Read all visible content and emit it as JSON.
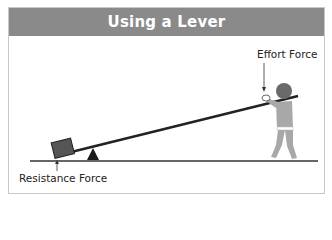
{
  "diagram": {
    "title": "Using a Lever",
    "labels": {
      "effort": "Effort Force",
      "resistance": "Resistance Force"
    },
    "elements": [
      "lever-bar",
      "fulcrum",
      "load-box",
      "person",
      "ground-line"
    ],
    "colors": {
      "header_bg": "#8a8a8a",
      "header_text": "#ffffff",
      "border": "#c8c8c8",
      "lever": "#222222",
      "fulcrum": "#1a1a1a",
      "load": "#555555",
      "person_body": "#a8a8a8",
      "person_head": "#6a6a6a"
    }
  }
}
